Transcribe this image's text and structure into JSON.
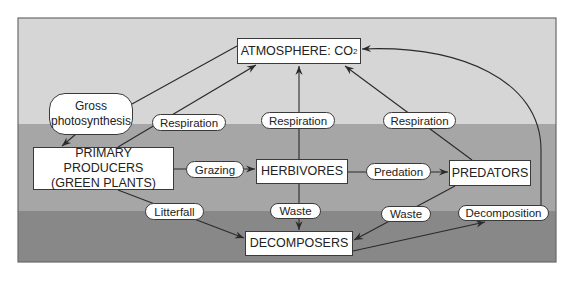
{
  "diagram": {
    "colors": {
      "band_top": "#d6d6d6",
      "band_middle": "#a6a6a6",
      "band_bottom": "#888888",
      "frame": "#6a6a6a",
      "line": "#2a2a2a",
      "node_fill": "#ffffff"
    },
    "bands": [
      {
        "name": "top-band",
        "y": 18,
        "height": 106,
        "color": "#d6d6d6"
      },
      {
        "name": "middle-band",
        "y": 124,
        "height": 87,
        "color": "#a6a6a6"
      },
      {
        "name": "bottom-band",
        "y": 211,
        "height": 51,
        "color": "#888888"
      }
    ],
    "frame": {
      "x": 18,
      "y": 18,
      "width": 538,
      "height": 244
    },
    "nodes": {
      "atmosphere": {
        "label": "ATMOSPHERE: CO",
        "subscript": "2",
        "x": 237,
        "y": 38,
        "w": 124,
        "h": 26,
        "kind": "box"
      },
      "producers": {
        "label_line1": "PRIMARY PRODUCERS",
        "label_line2": "(GREEN PLANTS)",
        "x": 33,
        "y": 147,
        "w": 141,
        "h": 43,
        "kind": "box"
      },
      "herbivores": {
        "label": "HERBIVORES",
        "x": 256,
        "y": 159,
        "w": 92,
        "h": 25,
        "kind": "box"
      },
      "predators": {
        "label": "PREDATORS",
        "x": 449,
        "y": 160,
        "w": 82,
        "h": 26,
        "kind": "box"
      },
      "decomposers": {
        "label": "DECOMPOSERS",
        "x": 245,
        "y": 231,
        "w": 108,
        "h": 25,
        "kind": "box"
      }
    },
    "process_labels": {
      "gross_photosynthesis": {
        "label_line1": "Gross",
        "label_line2": "photosynthesis",
        "x": 49,
        "y": 93,
        "w": 84,
        "h": 42
      },
      "respiration_producers": {
        "label": "Respiration",
        "x": 152,
        "y": 114,
        "w": 74,
        "h": 17
      },
      "respiration_herbivores": {
        "label": "Respiration",
        "x": 261,
        "y": 112,
        "w": 74,
        "h": 17
      },
      "respiration_predators": {
        "label": "Respiration",
        "x": 383,
        "y": 112,
        "w": 73,
        "h": 17
      },
      "grazing": {
        "label": "Grazing",
        "x": 186,
        "y": 161,
        "w": 58,
        "h": 17
      },
      "predation": {
        "label": "Predation",
        "x": 366,
        "y": 163,
        "w": 65,
        "h": 17
      },
      "litterfall": {
        "label": "Litterfall",
        "x": 145,
        "y": 203,
        "w": 59,
        "h": 17
      },
      "waste_herbivores": {
        "label": "Waste",
        "x": 270,
        "y": 203,
        "w": 51,
        "h": 16
      },
      "waste_predators": {
        "label": "Waste",
        "x": 381,
        "y": 206,
        "w": 50,
        "h": 16
      },
      "decomposition": {
        "label": "Decomposition",
        "x": 458,
        "y": 205,
        "w": 91,
        "h": 16
      }
    },
    "edges": [
      {
        "name": "atmosphere-to-producers-gross-photosynthesis",
        "d": "M237,46 L132,104 M76,134 L62,146",
        "arrow_at": [
          62,
          146
        ],
        "arrow_from": [
          76,
          134
        ]
      },
      {
        "name": "producers-respiration-to-atmosphere",
        "d": "M118,147 L256,65",
        "arrow_at": [
          256,
          65
        ],
        "arrow_from": [
          118,
          147
        ]
      },
      {
        "name": "herbivores-respiration-to-atmosphere",
        "d": "M299,159 L299,66",
        "arrow_at": [
          299,
          66
        ],
        "arrow_from": [
          299,
          159
        ]
      },
      {
        "name": "predators-respiration-to-atmosphere",
        "d": "M472,160 L345,66",
        "arrow_at": [
          345,
          66
        ],
        "arrow_from": [
          472,
          160
        ]
      },
      {
        "name": "producers-grazing-to-herbivores",
        "d": "M174,169 L255,169",
        "arrow_at": [
          255,
          169
        ],
        "arrow_from": [
          174,
          169
        ]
      },
      {
        "name": "herbivores-predation-to-predators",
        "d": "M348,172 L448,172",
        "arrow_at": [
          448,
          172
        ],
        "arrow_from": [
          348,
          172
        ]
      },
      {
        "name": "producers-litterfall-to-decomposers",
        "d": "M118,190 L244,238",
        "arrow_at": [
          244,
          238
        ],
        "arrow_from": [
          118,
          190
        ]
      },
      {
        "name": "herbivores-waste-to-decomposers",
        "d": "M299,184 L299,230",
        "arrow_at": [
          299,
          230
        ],
        "arrow_from": [
          299,
          184
        ]
      },
      {
        "name": "predators-waste-to-decomposers",
        "d": "M455,186 L354,240",
        "arrow_at": [
          354,
          240
        ],
        "arrow_from": [
          455,
          186
        ]
      },
      {
        "name": "decomposers-to-decomposition",
        "d": "M353,251 L485,222",
        "arrow_at": [
          485,
          222
        ],
        "arrow_from": [
          353,
          251
        ]
      },
      {
        "name": "decomposition-to-atmosphere",
        "d": "M541,205 L541,150 C541,80 460,45 362,49",
        "arrow_at": [
          362,
          49
        ],
        "arrow_from": [
          380,
          48
        ]
      }
    ]
  }
}
